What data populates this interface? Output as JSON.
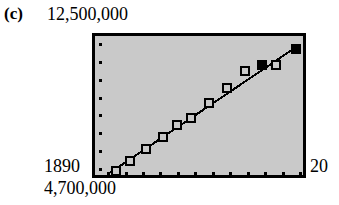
{
  "figure": {
    "panel_label": "(c)",
    "y_axis_top_label": "12,500,000",
    "y_axis_bottom_label": "4,700,000",
    "x_axis_left_label": "1890",
    "x_axis_right_label": "20",
    "plot_background_color": "#c9c9c9",
    "frame_color": "#000000",
    "marker_color": "#000000"
  },
  "chart_data": {
    "type": "scatter",
    "title": "(c)",
    "xlabel": "",
    "ylabel": "",
    "xlim": [
      1890,
      2000
    ],
    "ylim": [
      4700000,
      12500000
    ],
    "xtick_labels": [
      "1890",
      "20"
    ],
    "ytick_labels": [
      "4,700,000",
      "12,500,000"
    ],
    "grid": false,
    "legend": null,
    "axis_tick_style": "dots",
    "x_tick_count": 12,
    "y_tick_count": 8,
    "series": [
      {
        "name": "observed",
        "marker": "square",
        "points": [
          {
            "x": 1896,
            "y": 4800000,
            "filled": false
          },
          {
            "x": 1904,
            "y": 5400000,
            "filled": false
          },
          {
            "x": 1913,
            "y": 6150000,
            "filled": false
          },
          {
            "x": 1922,
            "y": 6900000,
            "filled": false
          },
          {
            "x": 1930,
            "y": 7600000,
            "filled": false
          },
          {
            "x": 1938,
            "y": 8000000,
            "filled": false
          },
          {
            "x": 1948,
            "y": 8950000,
            "filled": false
          },
          {
            "x": 1958,
            "y": 9850000,
            "filled": false
          },
          {
            "x": 1968,
            "y": 10850000,
            "filled": false
          },
          {
            "x": 1977,
            "y": 11250000,
            "filled": true
          },
          {
            "x": 1985,
            "y": 11250000,
            "filled": false
          },
          {
            "x": 1996,
            "y": 12200000,
            "filled": true
          }
        ]
      },
      {
        "name": "fitted-line",
        "type": "line",
        "x": [
          1893,
          1996
        ],
        "y": [
          4730000,
          12300000
        ]
      }
    ]
  }
}
